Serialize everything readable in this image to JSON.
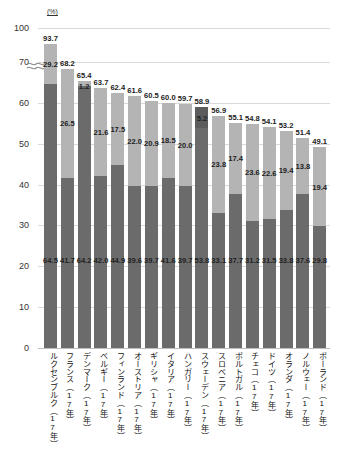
{
  "chart": {
    "type": "bar",
    "unit_label": "(%)",
    "y_axis": {
      "ticks": [
        "0",
        "10",
        "20",
        "30",
        "40",
        "50",
        "60",
        "70",
        "100"
      ],
      "has_break": true,
      "break_between": [
        "70",
        "100"
      ],
      "grid": true
    }
  },
  "chart_data": {
    "type": "bar",
    "title": "",
    "subtitle": "",
    "xlabel": "",
    "ylabel": "(%)",
    "ylim": [
      0,
      100
    ],
    "grid": true,
    "stacked": true,
    "legend_position": "none",
    "axis_break": {
      "from": 71,
      "to": 92
    },
    "categories": [
      "ルクセンブルク（17年）",
      "フランス（17年）",
      "デンマーク（17年）",
      "ベルギー（17年）",
      "フィンランド（17年）",
      "オーストリア（17年）",
      "ギリシャ（17年）",
      "イタリア（17年）",
      "ハンガリー（17年）",
      "スウェーデン（17年）",
      "スロベニア（17年）",
      "ポルトガル（17年）",
      "チェコ（17年）",
      "ドイツ（17年）",
      "オランダ（17年）",
      "ノルウェー（17年）",
      "ポーランド（17年）"
    ],
    "series": [
      {
        "name": "lower",
        "values": [
          64.5,
          41.7,
          64.2,
          42.0,
          44.9,
          39.6,
          39.7,
          41.6,
          39.7,
          53.8,
          33.1,
          37.7,
          31.2,
          31.5,
          33.8,
          37.6,
          29.8
        ]
      },
      {
        "name": "upper",
        "values": [
          29.2,
          26.5,
          1.2,
          21.6,
          17.5,
          22.0,
          20.9,
          18.5,
          20.0,
          5.2,
          23.8,
          17.4,
          23.6,
          22.6,
          19.4,
          13.8,
          19.4
        ]
      }
    ],
    "totals": [
      93.7,
      68.2,
      65.4,
      63.7,
      62.4,
      61.6,
      60.5,
      60.0,
      59.7,
      58.9,
      56.9,
      55.1,
      54.8,
      54.1,
      53.2,
      51.4,
      49.1
    ]
  },
  "colors": {
    "lower_segment": "#6b6b6b",
    "upper_segment": "#b4b4b4",
    "upper_segment_dark": "#5c5c5c",
    "gridline": "#d9d9d9",
    "text": "#1a1a1a",
    "background": "#ffffff"
  }
}
